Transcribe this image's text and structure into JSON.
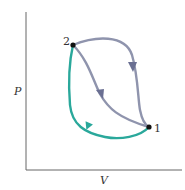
{
  "diagram": {
    "type": "PV diagram",
    "axes": {
      "y_label": "P",
      "x_label": "V"
    },
    "points": [
      {
        "id": "1",
        "label": "1"
      },
      {
        "id": "2",
        "label": "2"
      }
    ],
    "paths": [
      {
        "name": "upper-path",
        "from": "2",
        "to": "1",
        "color": "#8f94ad"
      },
      {
        "name": "middle-path",
        "from": "2",
        "to": "1",
        "color": "#8f94ad"
      },
      {
        "name": "return-path",
        "from": "1",
        "to": "2",
        "color": "#2aa89b"
      }
    ],
    "colors": {
      "axis": "#666666",
      "process": "#8f94ad",
      "arrow": "#6a6f92",
      "return": "#2aa89b",
      "point": "#111111"
    }
  }
}
